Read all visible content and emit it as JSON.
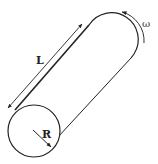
{
  "diagram": {
    "labels": {
      "length": "L",
      "radius": "R",
      "angular_velocity": "ω"
    },
    "colors": {
      "stroke": "#222222",
      "background": "#ffffff"
    }
  }
}
